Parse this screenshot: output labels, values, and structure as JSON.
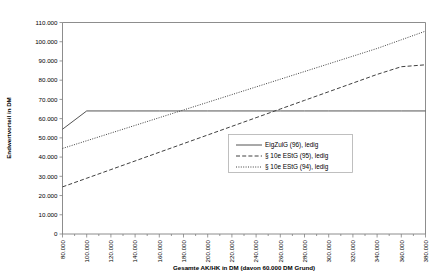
{
  "chart_data": {
    "type": "line",
    "title": "",
    "xlabel": "Gesamte AK/HK in DM (davon 60.000 DM Grund)",
    "ylabel": "Endwertvorteil in DM",
    "xlim": [
      80000,
      380000
    ],
    "ylim": [
      0,
      110000
    ],
    "grid": false,
    "legend_position": "center-right-inside",
    "x_tick_labels": [
      "80.000",
      "100.000",
      "120.000",
      "140.000",
      "160.000",
      "180.000",
      "200.000",
      "220.000",
      "240.000",
      "260.000",
      "280.000",
      "300.000",
      "320.000",
      "340.000",
      "360.000",
      "380.000"
    ],
    "x_tick_values": [
      80000,
      100000,
      120000,
      140000,
      160000,
      180000,
      200000,
      220000,
      240000,
      260000,
      280000,
      300000,
      320000,
      340000,
      360000,
      380000
    ],
    "y_tick_labels": [
      "0",
      "10.000",
      "20.000",
      "30.000",
      "40.000",
      "50.000",
      "60.000",
      "70.000",
      "80.000",
      "90.000",
      "100.000",
      "110.000"
    ],
    "y_tick_values": [
      0,
      10000,
      20000,
      30000,
      40000,
      50000,
      60000,
      70000,
      80000,
      90000,
      100000,
      110000
    ],
    "series": [
      {
        "name": "EigZulG (96), ledig",
        "style": "solid",
        "color": "#404040",
        "x": [
          80000,
          100000,
          120000,
          140000,
          160000,
          180000,
          200000,
          220000,
          240000,
          260000,
          280000,
          300000,
          320000,
          340000,
          360000,
          380000
        ],
        "values": [
          54500,
          64000,
          64000,
          64000,
          64000,
          64000,
          64000,
          64000,
          64000,
          64000,
          64000,
          64000,
          64000,
          64000,
          64000,
          64000
        ]
      },
      {
        "name": "§ 10e EStG (95), ledig",
        "style": "dashed",
        "color": "#404040",
        "x": [
          80000,
          100000,
          120000,
          140000,
          160000,
          180000,
          200000,
          220000,
          240000,
          260000,
          280000,
          300000,
          320000,
          340000,
          360000,
          380000
        ],
        "values": [
          24500,
          29000,
          33500,
          38000,
          42500,
          47000,
          51500,
          56000,
          60500,
          65000,
          69500,
          74000,
          78500,
          83000,
          87000,
          88000
        ]
      },
      {
        "name": "§ 10e EStG (94), ledig",
        "style": "dotted",
        "color": "#404040",
        "x": [
          80000,
          100000,
          120000,
          140000,
          160000,
          180000,
          200000,
          220000,
          240000,
          260000,
          280000,
          300000,
          320000,
          340000,
          360000,
          380000
        ],
        "values": [
          44500,
          48500,
          52500,
          56500,
          60500,
          64500,
          68500,
          72500,
          76500,
          80500,
          84500,
          88500,
          92500,
          96500,
          101000,
          105500
        ]
      }
    ]
  },
  "legend": {
    "items": [
      {
        "label": "EigZulG (96), ledig",
        "style": "solid"
      },
      {
        "label": "§ 10e EStG (95), ledig",
        "style": "dashed"
      },
      {
        "label": "§ 10e EStG (94), ledig",
        "style": "dotted"
      }
    ]
  }
}
